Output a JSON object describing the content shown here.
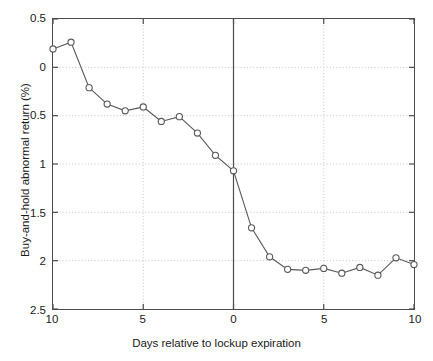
{
  "figure": {
    "background_color": "#ffffff",
    "frame_color": "#4c4c4c",
    "line_color": "#595959",
    "marker_face_color": "#ffffff",
    "grid_color": "#bfbfbf",
    "zero_line_color": "#4c4c4c"
  },
  "chart_data": {
    "type": "line",
    "title": "",
    "subtitle": "",
    "xlabel": "Days relative to lockup expiration",
    "ylabel": "Buy-and-hold abnormal return (%)",
    "xlim": [
      -10,
      10
    ],
    "ylim": [
      -2.5,
      0.5
    ],
    "grid": true,
    "grid_style": "dotted",
    "legend": null,
    "legend_position": "none",
    "x_tick_values": [
      -10,
      -5,
      0,
      5,
      10
    ],
    "x_tick_labels": [
      "10",
      "5",
      "0",
      "5",
      "10"
    ],
    "y_tick_values": [
      0.5,
      0,
      -0.5,
      -1,
      -1.5,
      -2,
      -2.5
    ],
    "y_tick_labels": [
      "0.5",
      "0",
      "0.5",
      "1",
      "1.5",
      "2",
      "2.5"
    ],
    "annotations": [
      {
        "name": "lockup-expiration-line",
        "type": "vline",
        "x": 0
      }
    ],
    "series": [
      {
        "name": "Buy-and-hold abnormal return",
        "marker": "circle",
        "x": [
          -10,
          -9,
          -8,
          -7,
          -6,
          -5,
          -4,
          -3,
          -2,
          -1,
          0,
          1,
          2,
          3,
          4,
          5,
          6,
          7,
          8,
          9,
          10
        ],
        "values": [
          0.19,
          0.26,
          -0.21,
          -0.38,
          -0.45,
          -0.41,
          -0.56,
          -0.51,
          -0.68,
          -0.91,
          -1.07,
          -1.66,
          -1.96,
          -2.09,
          -2.1,
          -2.08,
          -2.13,
          -2.07,
          -2.15,
          -1.97,
          -2.04
        ]
      }
    ]
  },
  "x_ticks": [
    {
      "value": -10,
      "label": "10"
    },
    {
      "value": -5,
      "label": "5"
    },
    {
      "value": 0,
      "label": "0"
    },
    {
      "value": 5,
      "label": "5"
    },
    {
      "value": 10,
      "label": "10"
    }
  ],
  "y_ticks": [
    {
      "value": 0.5,
      "label": "0.5"
    },
    {
      "value": 0,
      "label": "0"
    },
    {
      "value": -0.5,
      "label": "0.5"
    },
    {
      "value": -1,
      "label": "1"
    },
    {
      "value": -1.5,
      "label": "1.5"
    },
    {
      "value": -2,
      "label": "2"
    },
    {
      "value": -2.5,
      "label": "2.5"
    }
  ]
}
